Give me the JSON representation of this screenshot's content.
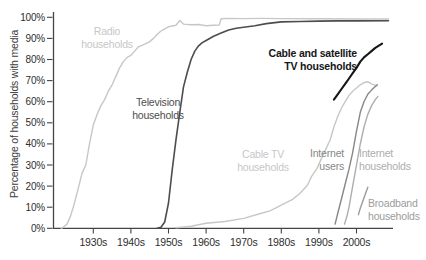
{
  "chart_data": {
    "type": "line",
    "title": "",
    "xlabel": "",
    "ylabel": "Percentage of households with media",
    "xlim": [
      1919.8,
      2010
    ],
    "ylim": [
      0,
      100
    ],
    "grid": false,
    "legend_position": "inline-labels",
    "axis": {
      "color": "#444444",
      "tick_label_color": "#2e2e2e"
    },
    "y_ticks": [
      {
        "value": 0,
        "label": "0%"
      },
      {
        "value": 10,
        "label": "10%"
      },
      {
        "value": 20,
        "label": "20%"
      },
      {
        "value": 30,
        "label": "30%"
      },
      {
        "value": 40,
        "label": "40%"
      },
      {
        "value": 50,
        "label": "50%"
      },
      {
        "value": 60,
        "label": "60%"
      },
      {
        "value": 70,
        "label": "70%"
      },
      {
        "value": 80,
        "label": "80%"
      },
      {
        "value": 90,
        "label": "90%"
      },
      {
        "value": 100,
        "label": "100%"
      }
    ],
    "x_ticks": [
      {
        "value": 1930,
        "label": "1930s"
      },
      {
        "value": 1940,
        "label": "1940s"
      },
      {
        "value": 1950,
        "label": "1950s"
      },
      {
        "value": 1960,
        "label": "1960s"
      },
      {
        "value": 1970,
        "label": "1970s"
      },
      {
        "value": 1980,
        "label": "1980s"
      },
      {
        "value": 1990,
        "label": "1990s"
      },
      {
        "value": 2000,
        "label": "2000s"
      }
    ],
    "series": [
      {
        "id": "radio_households",
        "name": "Radio households",
        "color": "#c7c7c7",
        "stroke_width": 1.4,
        "label": {
          "lines": [
            "Radio",
            "households"
          ],
          "x": 107,
          "y": 35,
          "anchor": "middle",
          "color": "#c7c7c7",
          "bold": false
        },
        "points": [
          [
            1921.5,
            0
          ],
          [
            1922,
            0.5
          ],
          [
            1923,
            2
          ],
          [
            1924,
            6
          ],
          [
            1925,
            12
          ],
          [
            1926,
            19
          ],
          [
            1927,
            26
          ],
          [
            1928,
            30
          ],
          [
            1929,
            40
          ],
          [
            1930,
            49
          ],
          [
            1931,
            54
          ],
          [
            1932,
            58
          ],
          [
            1933,
            61
          ],
          [
            1934,
            65
          ],
          [
            1935,
            68
          ],
          [
            1936,
            72
          ],
          [
            1937,
            76
          ],
          [
            1938,
            79
          ],
          [
            1939,
            81
          ],
          [
            1940,
            82
          ],
          [
            1941,
            84
          ],
          [
            1942,
            86
          ],
          [
            1944,
            87.5
          ],
          [
            1945,
            88.5
          ],
          [
            1946,
            90
          ],
          [
            1947,
            92
          ],
          [
            1948,
            93.5
          ],
          [
            1949,
            94.5
          ],
          [
            1950,
            95.5
          ],
          [
            1952,
            96.2
          ],
          [
            1953,
            98.5
          ],
          [
            1954,
            96.8
          ],
          [
            1956,
            96.5
          ],
          [
            1958,
            96.6
          ],
          [
            1960,
            96
          ],
          [
            1962,
            96.2
          ],
          [
            1963.5,
            96.3
          ],
          [
            1964,
            99.3
          ],
          [
            1966,
            99.5
          ],
          [
            1970,
            99.4
          ],
          [
            1975,
            99.5
          ],
          [
            1980,
            99.4
          ],
          [
            1990,
            99.3
          ],
          [
            2000,
            99.2
          ],
          [
            2008.5,
            99.2
          ]
        ]
      },
      {
        "id": "television_households",
        "name": "Television households",
        "color": "#4d4d4d",
        "stroke_width": 1.6,
        "label": {
          "lines": [
            "Television",
            "households"
          ],
          "x": 158,
          "y": 106,
          "anchor": "middle",
          "color": "#4d4d4d",
          "bold": false
        },
        "points": [
          [
            1947,
            0
          ],
          [
            1948,
            0.5
          ],
          [
            1949,
            3
          ],
          [
            1950,
            12
          ],
          [
            1951,
            28
          ],
          [
            1952,
            42
          ],
          [
            1953,
            55
          ],
          [
            1954,
            67
          ],
          [
            1955,
            74
          ],
          [
            1956,
            80
          ],
          [
            1957,
            84
          ],
          [
            1958,
            86.5
          ],
          [
            1959,
            88
          ],
          [
            1960,
            89
          ],
          [
            1962,
            91
          ],
          [
            1964,
            92.5
          ],
          [
            1966,
            94
          ],
          [
            1968,
            94.8
          ],
          [
            1970,
            95.3
          ],
          [
            1973,
            96
          ],
          [
            1976,
            97
          ],
          [
            1980,
            97.8
          ],
          [
            1985,
            98
          ],
          [
            1990,
            98.2
          ],
          [
            1995,
            98.3
          ],
          [
            2000,
            98.3
          ],
          [
            2008.5,
            98.4
          ]
        ]
      },
      {
        "id": "cable_tv_households",
        "name": "Cable TV households",
        "color": "#c7c7c7",
        "stroke_width": 1.4,
        "label": {
          "lines": [
            "Cable TV",
            "households"
          ],
          "x": 263,
          "y": 158,
          "anchor": "middle",
          "color": "#c7c7c7",
          "bold": false
        },
        "points": [
          [
            1952,
            0.3
          ],
          [
            1956,
            1
          ],
          [
            1960,
            2.4
          ],
          [
            1965,
            3.2
          ],
          [
            1970,
            4.7
          ],
          [
            1974,
            6.8
          ],
          [
            1977,
            8.3
          ],
          [
            1980,
            11
          ],
          [
            1983,
            13.7
          ],
          [
            1985,
            16.6
          ],
          [
            1987,
            20.5
          ],
          [
            1988,
            24.5
          ],
          [
            1989.5,
            28.4
          ],
          [
            1990.5,
            32.4
          ],
          [
            1991.3,
            35.5
          ],
          [
            1993,
            42
          ],
          [
            1994,
            48
          ],
          [
            1995,
            53
          ],
          [
            1996,
            57
          ],
          [
            1997,
            60
          ],
          [
            1998,
            63
          ],
          [
            1999,
            65
          ],
          [
            2000,
            66.5
          ],
          [
            2001,
            68
          ],
          [
            2002,
            69
          ],
          [
            2003,
            69.5
          ],
          [
            2004,
            68.5
          ],
          [
            2005.5,
            67.5
          ]
        ]
      },
      {
        "id": "cable_satellite_tv_households",
        "name": "Cable and satellite TV households",
        "color": "#161616",
        "stroke_width": 2.1,
        "label": {
          "lines": [
            "Cable and satellite",
            "TV households"
          ],
          "x": 357,
          "y": 57,
          "anchor": "end",
          "color": "#161616",
          "bold": true
        },
        "points": [
          [
            1994,
            61
          ],
          [
            1995,
            63.5
          ],
          [
            1996,
            66
          ],
          [
            1997,
            68.5
          ],
          [
            1998,
            71
          ],
          [
            1999,
            73.5
          ],
          [
            2000,
            76
          ],
          [
            2001,
            79
          ],
          [
            2002,
            81
          ],
          [
            2003,
            82.5
          ],
          [
            2004,
            84
          ],
          [
            2005,
            85.5
          ],
          [
            2006.8,
            87.5
          ]
        ]
      },
      {
        "id": "internet_users",
        "name": "Internet users",
        "color": "#878787",
        "stroke_width": 1.4,
        "label": {
          "lines": [
            "Internet",
            "users"
          ],
          "x": 344,
          "y": 157,
          "anchor": "end",
          "color": "#878787",
          "bold": false
        },
        "points": [
          [
            1994.3,
            2
          ],
          [
            1995,
            7
          ],
          [
            1996,
            14
          ],
          [
            1997,
            21
          ],
          [
            1998,
            28
          ],
          [
            1999,
            36
          ],
          [
            2000,
            46
          ],
          [
            2001,
            55
          ],
          [
            2002,
            60
          ],
          [
            2003,
            63.5
          ],
          [
            2004,
            65.5
          ],
          [
            2005.5,
            68
          ]
        ]
      },
      {
        "id": "internet_households",
        "name": "Internet households",
        "color": "#adadad",
        "stroke_width": 1.4,
        "label": {
          "lines": [
            "Internet",
            "households"
          ],
          "x": 359,
          "y": 157,
          "anchor": "start",
          "color": "#adadad",
          "bold": false
        },
        "points": [
          [
            1996.8,
            2
          ],
          [
            1997.5,
            6
          ],
          [
            1998,
            10
          ],
          [
            1999,
            20
          ],
          [
            2000,
            30
          ],
          [
            2001,
            40
          ],
          [
            2002,
            48
          ],
          [
            2003,
            54
          ],
          [
            2004,
            58
          ],
          [
            2005,
            61
          ],
          [
            2005.7,
            62.5
          ]
        ]
      },
      {
        "id": "broadband_households",
        "name": "Broadband households",
        "color": "#9c9c9c",
        "stroke_width": 1.4,
        "label": {
          "lines": [
            "Broadband",
            "households"
          ],
          "x": 368,
          "y": 207,
          "anchor": "start",
          "color": "#9c9c9c",
          "bold": false
        },
        "points": [
          [
            2000.5,
            6.5
          ],
          [
            2001,
            9.5
          ],
          [
            2002,
            14.5
          ],
          [
            2003,
            19.5
          ]
        ]
      }
    ]
  }
}
